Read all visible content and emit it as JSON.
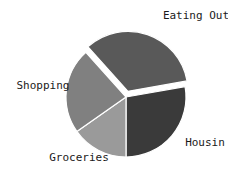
{
  "chart_data": {
    "type": "pie",
    "title": "",
    "categories": [
      "Eating Out",
      "Housin",
      "Groceries",
      "Shopping"
    ],
    "values": [
      34,
      25,
      15,
      26
    ],
    "labels": [
      "Eating Out",
      "Housin",
      "Groceries",
      "Shopping"
    ],
    "colors": [
      "#595959",
      "#3a3a3a",
      "#9a9a9a",
      "#808080"
    ],
    "exploded": [
      "Eating Out"
    ],
    "explode_offset_px": 6,
    "start_angle_deg": 10,
    "direction": "clockwise",
    "legend": "none",
    "grid": false,
    "background": "#ffffff",
    "label_color": "#1a1a1a",
    "center": {
      "x": 126,
      "y": 97
    },
    "radius": 60,
    "slices": [
      {
        "name": "Eating Out",
        "label": "Eating Out",
        "value": 34,
        "color": "#595959",
        "exploded": true,
        "start_deg": 10,
        "end_deg": 132,
        "label_x": 196,
        "label_y": 16,
        "label_anchor": "middle"
      },
      {
        "name": "Housin",
        "label": "Housin",
        "value": 25,
        "color": "#3a3a3a",
        "exploded": false,
        "start_deg": -90,
        "end_deg": 10,
        "label_x": 205,
        "label_y": 143,
        "label_anchor": "middle"
      },
      {
        "name": "Groceries",
        "label": "Groceries",
        "value": 15,
        "color": "#9a9a9a",
        "exploded": false,
        "start_deg": -145,
        "end_deg": -90,
        "label_x": 79,
        "label_y": 158,
        "label_anchor": "middle"
      },
      {
        "name": "Shopping",
        "label": "Shopping",
        "value": 26,
        "color": "#808080",
        "exploded": false,
        "start_deg": -228,
        "end_deg": -145,
        "label_x": 43,
        "label_y": 86,
        "label_anchor": "middle"
      }
    ]
  }
}
